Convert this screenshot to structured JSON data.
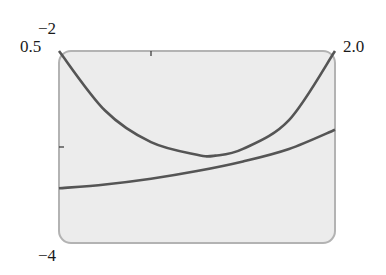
{
  "chart_data": {
    "type": "line",
    "title": "",
    "xlabel": "",
    "ylabel": "",
    "xlim": [
      0.5,
      2.0
    ],
    "ylim": [
      -4,
      -2
    ],
    "x_tick_labels": [
      "0.5",
      "2.0"
    ],
    "y_tick_labels": [
      "-2",
      "-4"
    ],
    "grid": false,
    "legend": null,
    "series": [
      {
        "name": "U-shaped curve",
        "color": "#555555",
        "x": [
          0.5,
          0.75,
          1.0,
          1.25,
          1.35,
          1.5,
          1.75,
          2.0
        ],
        "y": [
          -2.0,
          -2.62,
          -2.95,
          -3.08,
          -3.09,
          -3.02,
          -2.72,
          -2.0
        ]
      },
      {
        "name": "increasing curve",
        "color": "#555555",
        "x": [
          0.5,
          0.75,
          1.0,
          1.25,
          1.5,
          1.75,
          2.0
        ],
        "y": [
          -3.43,
          -3.39,
          -3.33,
          -3.25,
          -3.15,
          -3.02,
          -2.82
        ]
      }
    ],
    "annotations": []
  },
  "labels": {
    "ymax": "−2",
    "ymin": "−4",
    "xmin": "0.5",
    "xmax": "2.0"
  },
  "style": {
    "plot_bg": "#ececec",
    "frame": "#b3b3b3",
    "curve": "#555555"
  }
}
